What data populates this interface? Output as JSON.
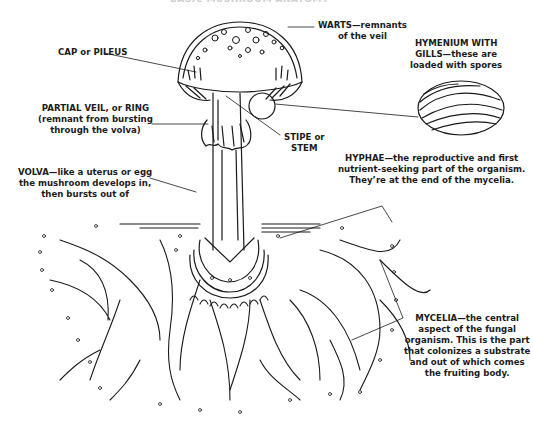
{
  "title": "BASIC MUSHROOM ANATOMY",
  "labels": {
    "warts": [
      "WARTS—remnants",
      "of the veil"
    ],
    "hymenium": [
      "HYMENIUM WITH",
      "GILLS—these are",
      "loaded with spores"
    ],
    "cap": [
      "CAP or PILEUS"
    ],
    "partial_veil": [
      "PARTIAL VEIL, or RING",
      "(remnant from bursting",
      "through the volva)"
    ],
    "stipe": [
      "STIPE or",
      "STEM"
    ],
    "volva": [
      "VOLVA—like a uterus or egg",
      "the mushroom develops in,",
      "then bursts out of"
    ],
    "hyphae": [
      "HYPHAE—the reproductive and first",
      "nutrient-seeking part of the organism.",
      "They’re at the end of the mycelia."
    ],
    "mycelia": [
      "MYCELIA—the central",
      "aspect of the fungal",
      "organism. This is the part",
      "that colonizes a substrate",
      "and out of which comes",
      "the fruiting body."
    ]
  },
  "colors": {
    "ink": "#1a1a1a",
    "background": "#ffffff"
  }
}
